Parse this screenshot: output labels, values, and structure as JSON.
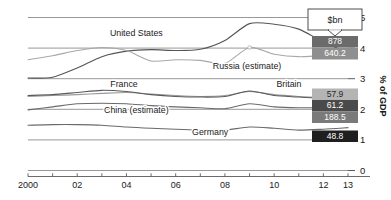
{
  "chart_data": {
    "type": "line",
    "title": "",
    "subtitle": "",
    "xlabel": "",
    "ylabel": "% of GDP",
    "unit_callout": "$bn",
    "xlim": [
      2000,
      2013
    ],
    "ylim": [
      0,
      5
    ],
    "y_ticks": [
      "0",
      "1",
      "2",
      "3",
      "4",
      "5"
    ],
    "y_tick_values": [
      0,
      1,
      2,
      3,
      4,
      5
    ],
    "x_ticks": [
      "2000",
      "02",
      "04",
      "06",
      "08",
      "10",
      "12",
      "13"
    ],
    "x_tick_values": [
      2000,
      2002,
      2004,
      2006,
      2008,
      2010,
      2012,
      2013
    ],
    "x_minor_ticks": [
      2001,
      2003,
      2005,
      2007,
      2009,
      2011
    ],
    "grid": false,
    "legend": "inline-labels",
    "legend_position": "inline",
    "years": [
      2000,
      2001,
      2002,
      2003,
      2004,
      2005,
      2006,
      2007,
      2008,
      2009,
      2010,
      2011,
      2012,
      2013
    ],
    "series": [
      {
        "name": "United States",
        "label": "United States",
        "color": "#555555",
        "value_label": "878",
        "value_badge_color": "#6b6b6b",
        "values": [
          3.02,
          3.05,
          3.35,
          3.72,
          3.9,
          3.95,
          3.92,
          3.96,
          4.25,
          4.8,
          4.78,
          4.62,
          4.2,
          3.85
        ]
      },
      {
        "name": "Russia (estimate)",
        "label": "Russia (estimate)",
        "color": "#a8a8a8",
        "value_label": "640.2",
        "value_badge_color": "#8f8f8f",
        "values": [
          3.62,
          3.75,
          3.92,
          4.02,
          3.92,
          3.58,
          3.62,
          3.6,
          3.5,
          4.02,
          3.8,
          3.72,
          3.78,
          3.92
        ]
      },
      {
        "name": "Britain",
        "label": "Britain",
        "color": "#9a9a9a",
        "value_label": "57.9",
        "value_badge_color": "#b4b4b4",
        "values": [
          2.42,
          2.45,
          2.48,
          2.52,
          2.55,
          2.5,
          2.45,
          2.42,
          2.45,
          2.58,
          2.48,
          2.42,
          2.38,
          2.3
        ]
      },
      {
        "name": "France",
        "label": "France",
        "color": "#5a5a5a",
        "value_label": "61.2",
        "value_badge_color": "#4a4a4a",
        "values": [
          2.45,
          2.48,
          2.55,
          2.62,
          2.58,
          2.48,
          2.42,
          2.4,
          2.42,
          2.6,
          2.45,
          2.4,
          2.35,
          2.28
        ]
      },
      {
        "name": "China (estimate)",
        "label": "China (estimate)",
        "color": "#6a6a6a",
        "value_label": "188.5",
        "value_badge_color": "#7a7a7a",
        "values": [
          1.98,
          2.08,
          2.18,
          2.2,
          2.18,
          2.12,
          2.08,
          2.05,
          2.02,
          2.18,
          2.08,
          2.05,
          2.05,
          2.02
        ]
      },
      {
        "name": "Germany",
        "label": "Germany",
        "color": "#6a6a6a",
        "value_label": "48.8",
        "value_badge_color": "#1f1f1f",
        "values": [
          1.48,
          1.5,
          1.5,
          1.48,
          1.42,
          1.38,
          1.35,
          1.32,
          1.32,
          1.42,
          1.38,
          1.32,
          1.35,
          1.4
        ]
      }
    ],
    "annotations": [
      {
        "text": "United States",
        "x": 2004.4,
        "y": 4.38
      },
      {
        "text": "Russia (estimate)",
        "x": 2008.9,
        "y": 3.33
      },
      {
        "text": "France",
        "x": 2003.9,
        "y": 2.72
      },
      {
        "text": "Britain",
        "x": 2010.6,
        "y": 2.72
      },
      {
        "text": "China (estimate)",
        "x": 2004.4,
        "y": 1.88
      },
      {
        "text": "Germany",
        "x": 2007.4,
        "y": 1.17
      }
    ]
  }
}
